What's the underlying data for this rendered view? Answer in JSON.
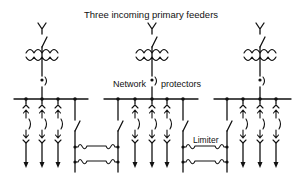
{
  "diagram": {
    "title": "Three incoming primary feeders",
    "labels": {
      "network_prefix": "Network",
      "network_suffix": "protectors",
      "limiter": "Limiter"
    },
    "colors": {
      "ink": "#111111",
      "background": "#ffffff"
    },
    "feeders": [
      {
        "id": "left",
        "x": 42
      },
      {
        "id": "middle",
        "x": 152
      },
      {
        "id": "right",
        "x": 260
      }
    ],
    "buses": [
      {
        "id": "left",
        "x1": 14,
        "x2": 88,
        "y": 99,
        "taps": [
          26,
          42,
          58,
          75
        ],
        "load_taps": [
          26,
          42,
          58
        ]
      },
      {
        "id": "middle",
        "x1": 104,
        "x2": 198,
        "y": 99,
        "taps": [
          118,
          135,
          152,
          167,
          183
        ],
        "load_taps": [
          135,
          152,
          167
        ]
      },
      {
        "id": "right",
        "x1": 214,
        "x2": 291,
        "y": 99,
        "taps": [
          227,
          243,
          260,
          276
        ],
        "load_taps": [
          243,
          260,
          276
        ]
      }
    ],
    "ties": [
      {
        "id": "left-middle",
        "xa": 75,
        "xb": 118,
        "cable_y": [
          147,
          162
        ],
        "has_limiter_label": false
      },
      {
        "id": "middle-right",
        "xa": 183,
        "xb": 227,
        "cable_y": [
          147,
          162
        ],
        "has_limiter_label": true
      }
    ]
  }
}
